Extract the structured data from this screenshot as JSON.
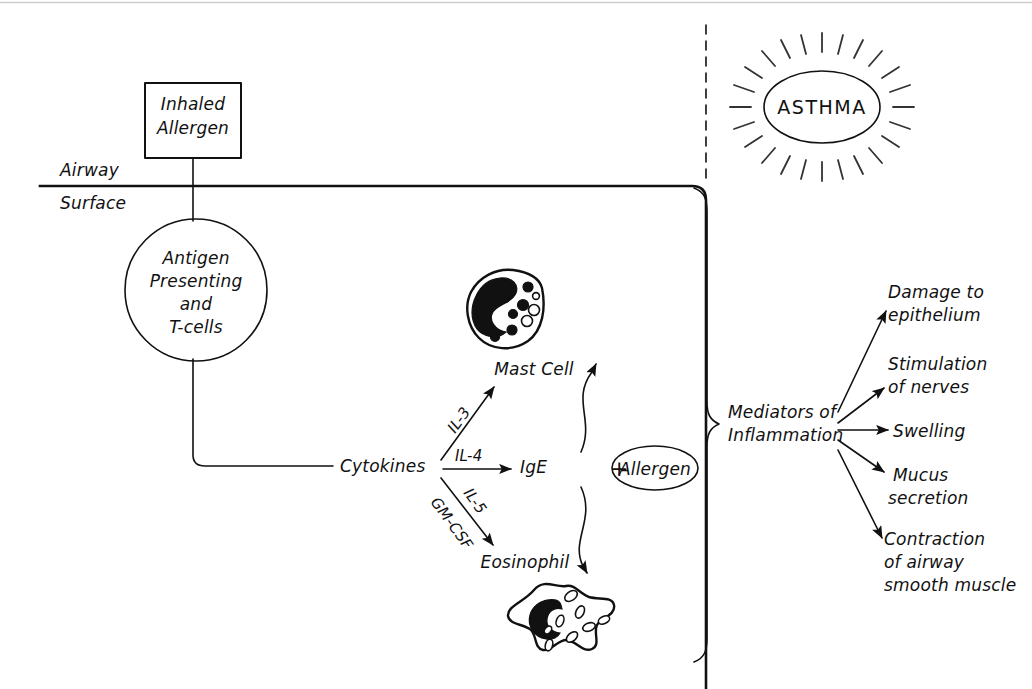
{
  "figure": {
    "background_color": "#ffffff",
    "ink_color": "#111111"
  },
  "nodes": {
    "inhaled_allergen": {
      "line1": "Inhaled",
      "line2": "Allergen"
    },
    "airway_label_top": "Airway",
    "airway_label_bottom": "Surface",
    "apc_circle": {
      "line1": "Antigen",
      "line2": "Presenting",
      "line3": "and",
      "line4": "T-cells"
    },
    "mast_cell": "Mast Cell",
    "eosinophil": "Eosinophil",
    "cytokines": "Cytokines",
    "ige": "IgE",
    "plus_sign": "+",
    "allergen_oval": "Allergen",
    "mediators": {
      "line1": "Mediators of",
      "line2": "Inflammation"
    },
    "asthma": "ASTHMA"
  },
  "arrow_labels": {
    "il3": "IL-3",
    "il4": "IL-4",
    "il5": "IL-5",
    "gmcsf": "GM-CSF"
  },
  "outcomes": [
    {
      "id": "damage",
      "line1": "Damage to",
      "line2": "epithelium",
      "line3": ""
    },
    {
      "id": "stimulation",
      "line1": "Stimulation",
      "line2": "of nerves",
      "line3": ""
    },
    {
      "id": "swelling",
      "line1": "Swelling",
      "line2": "",
      "line3": ""
    },
    {
      "id": "mucus",
      "line1": "Mucus",
      "line2": "secretion",
      "line3": ""
    },
    {
      "id": "contraction",
      "line1": "Contraction",
      "line2": "of airway",
      "line3": "smooth muscle"
    }
  ]
}
